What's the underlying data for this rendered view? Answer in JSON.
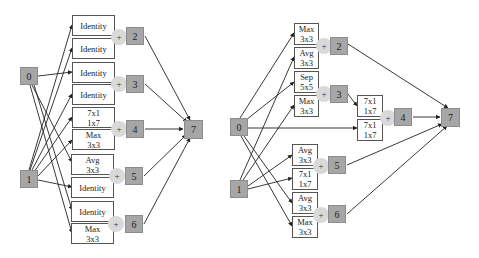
{
  "left_cell": {
    "inputs": [
      {
        "id": "0",
        "label": "0"
      },
      {
        "id": "1",
        "label": "1"
      }
    ],
    "ops": [
      {
        "lines": [
          "Identity"
        ],
        "target": "2"
      },
      {
        "lines": [
          "Identity"
        ],
        "target": "2"
      },
      {
        "lines": [
          "Identity"
        ],
        "target": "3"
      },
      {
        "lines": [
          "Identity"
        ],
        "target": "3"
      },
      {
        "lines": [
          "7x1",
          "1x7"
        ],
        "target": "4"
      },
      {
        "lines": [
          "Max",
          "3x3"
        ],
        "target": "4"
      },
      {
        "lines": [
          "Avg",
          "3x3"
        ],
        "target": "5"
      },
      {
        "lines": [
          "Identity"
        ],
        "target": "5"
      },
      {
        "lines": [
          "Identity"
        ],
        "target": "6"
      },
      {
        "lines": [
          "Max",
          "3x3"
        ],
        "target": "6"
      }
    ],
    "hidden_nodes": [
      "2",
      "3",
      "4",
      "5",
      "6"
    ],
    "output": "7",
    "plus_symbol": "+"
  },
  "right_cell": {
    "inputs": [
      {
        "id": "0",
        "label": "0"
      },
      {
        "id": "1",
        "label": "1"
      }
    ],
    "ops": [
      {
        "lines": [
          "Max",
          "3x3"
        ],
        "target": "2"
      },
      {
        "lines": [
          "Avg",
          "3x3"
        ],
        "target": "2"
      },
      {
        "lines": [
          "Sep",
          "5x5"
        ],
        "target": "3"
      },
      {
        "lines": [
          "Max",
          "3x3"
        ],
        "target": "3"
      },
      {
        "lines": [
          "7x1",
          "1x7"
        ],
        "target": "4"
      },
      {
        "lines": [
          "7x1",
          "1x7"
        ],
        "target": "4"
      },
      {
        "lines": [
          "Avg",
          "3x3"
        ],
        "target": "5"
      },
      {
        "lines": [
          "7x1",
          "1x7"
        ],
        "target": "5"
      },
      {
        "lines": [
          "Avg",
          "3x3"
        ],
        "target": "6"
      },
      {
        "lines": [
          "Max",
          "3x3"
        ],
        "target": "6"
      }
    ],
    "hidden_nodes": [
      "2",
      "3",
      "4",
      "5",
      "6"
    ],
    "output": "7",
    "plus_symbol": "+"
  }
}
